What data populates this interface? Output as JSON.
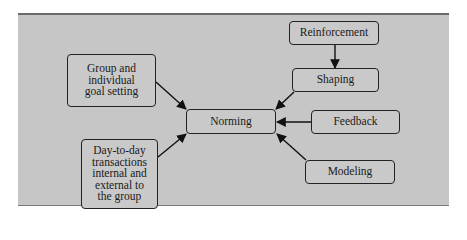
{
  "diagram": {
    "type": "flow",
    "colors": {
      "panel": "#c6c6c6",
      "node_fill": "#c9c9c9",
      "stroke": "#222222"
    },
    "nodes": [
      {
        "id": "group-goal",
        "label": "Group and individual goal setting",
        "lines": [
          "Group and",
          "individual",
          "goal setting"
        ]
      },
      {
        "id": "day-to-day",
        "label": "Day-to-day transactions internal and external to the group",
        "lines": [
          "Day-to-day",
          "transactions",
          "internal and",
          "external to",
          "the group"
        ]
      },
      {
        "id": "norming",
        "label": "Norming",
        "lines": [
          "Norming"
        ]
      },
      {
        "id": "reinforcement",
        "label": "Reinforcement",
        "lines": [
          "Reinforcement"
        ]
      },
      {
        "id": "shaping",
        "label": "Shaping",
        "lines": [
          "Shaping"
        ]
      },
      {
        "id": "feedback",
        "label": "Feedback",
        "lines": [
          "Feedback"
        ]
      },
      {
        "id": "modeling",
        "label": "Modeling",
        "lines": [
          "Modeling"
        ]
      }
    ],
    "edges": [
      {
        "from": "group-goal",
        "to": "norming"
      },
      {
        "from": "day-to-day",
        "to": "norming"
      },
      {
        "from": "reinforcement",
        "to": "shaping"
      },
      {
        "from": "shaping",
        "to": "norming"
      },
      {
        "from": "feedback",
        "to": "norming"
      },
      {
        "from": "modeling",
        "to": "norming"
      }
    ]
  }
}
